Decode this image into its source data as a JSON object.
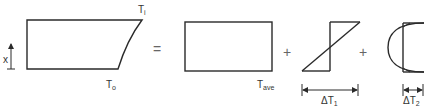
{
  "diagram": {
    "axis": {
      "label": "x"
    },
    "terms": [
      {
        "id": "total",
        "labels": {
          "top": "T",
          "top_sub": "i",
          "bottom": "T",
          "bottom_sub": "o"
        }
      },
      {
        "id": "uniform",
        "label": "T",
        "label_sub": "ave"
      },
      {
        "id": "linear",
        "dimension": "ΔT",
        "dimension_sub": "1"
      },
      {
        "id": "nonlinear",
        "dimension": "ΔT",
        "dimension_sub": "2"
      }
    ],
    "operators": [
      "=",
      "+",
      "+"
    ]
  }
}
